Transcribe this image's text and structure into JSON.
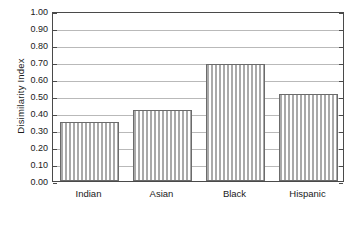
{
  "chart_data": {
    "type": "bar",
    "title": "",
    "subtitle": "",
    "xlabel": "",
    "ylabel": "Disimilarity Index",
    "categories": [
      "Indian",
      "Asian",
      "Black",
      "Hispanic"
    ],
    "values": [
      0.35,
      0.42,
      0.69,
      0.51
    ],
    "series": [
      {
        "name": "Dissimilarity Index",
        "values": [
          0.35,
          0.42,
          0.69,
          0.51
        ]
      }
    ],
    "ylim": [
      0.0,
      1.0
    ],
    "ytick_step": 0.1,
    "ytick_labels": [
      "0.00",
      "0.10",
      "0.20",
      "0.30",
      "0.40",
      "0.50",
      "0.60",
      "0.70",
      "0.80",
      "0.90",
      "1.00"
    ],
    "ytick_values": [
      0.0,
      0.1,
      0.2,
      0.3,
      0.4,
      0.5,
      0.6,
      0.7,
      0.8,
      0.9,
      1.0
    ],
    "grid": "horizontal",
    "legend": "none",
    "legend_position": "none",
    "annotations": [],
    "colors": {
      "background": "#ffffff",
      "plot_border": "#4a4a4a",
      "gridline": "#b9b9b9",
      "bar_fill_stripe": "#a9a9a9",
      "bar_fill_gap": "#ffffff",
      "bar_outline": "#6b6b6b",
      "text": "#1a1a1a"
    },
    "bar_fill_style": "vertical-stripe-hatch"
  }
}
